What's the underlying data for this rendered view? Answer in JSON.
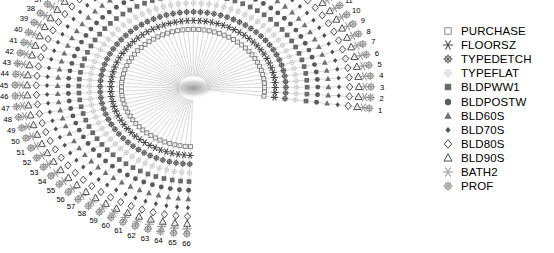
{
  "chart_data": {
    "type": "scatter",
    "title": "",
    "subtitle": "",
    "xlabel": "",
    "ylabel": "",
    "grid": false,
    "legend_position": "right",
    "n_spokes": 66,
    "spoke_labels": [
      "1",
      "2",
      "3",
      "4",
      "5",
      "6",
      "7",
      "8",
      "9",
      "10",
      "11",
      "12",
      "13",
      "14",
      "15",
      "16",
      "17",
      "18",
      "19",
      "20",
      "21",
      "22",
      "23",
      "24",
      "25",
      "26",
      "27",
      "28",
      "29",
      "30",
      "31",
      "32",
      "33",
      "34",
      "35",
      "36",
      "37",
      "38",
      "39",
      "40",
      "41",
      "42",
      "43",
      "44",
      "45",
      "46",
      "47",
      "48",
      "49",
      "50",
      "51",
      "52",
      "53",
      "54",
      "55",
      "56",
      "57",
      "58",
      "59",
      "60",
      "61",
      "62",
      "63",
      "64",
      "65",
      "66"
    ],
    "angle_start_deg": -8,
    "angle_end_deg": 268,
    "center": {
      "x": 193,
      "y": 88
    },
    "radius_inner": 26,
    "radius_outer": 178,
    "series": [
      {
        "name": "PURCHASE",
        "marker": "square-open",
        "color": "#7f7f7f",
        "ring": 1,
        "radius_frac": 0.3
      },
      {
        "name": "FLOORSZ",
        "marker": "asterisk",
        "color": "#4a4a4a",
        "ring": 2,
        "radius_frac": 0.37
      },
      {
        "name": "TYPEDETCH",
        "marker": "circle-plus",
        "color": "#555555",
        "ring": 3,
        "radius_frac": 0.44
      },
      {
        "name": "TYPEFLAT",
        "marker": "circle-faint",
        "color": "#cccccc",
        "ring": 4,
        "radius_frac": 0.51
      },
      {
        "name": "BLDPWW1",
        "marker": "square-filled",
        "color": "#6b6b6b",
        "ring": 5,
        "radius_frac": 0.58
      },
      {
        "name": "BLDPOSTW",
        "marker": "circle-filled",
        "color": "#5a5a5a",
        "ring": 6,
        "radius_frac": 0.65
      },
      {
        "name": "BLD60S",
        "marker": "triangle-filled",
        "color": "#707070",
        "ring": 7,
        "radius_frac": 0.72
      },
      {
        "name": "BLD70S",
        "marker": "diamond-small",
        "color": "#4f4f4f",
        "ring": 8,
        "radius_frac": 0.79
      },
      {
        "name": "BLD80S",
        "marker": "diamond-open",
        "color": "#3a3a3a",
        "ring": 9,
        "radius_frac": 0.86
      },
      {
        "name": "BLD90S",
        "marker": "triangle-open",
        "color": "#3a3a3a",
        "ring": 10,
        "radius_frac": 0.92
      },
      {
        "name": "BATH2",
        "marker": "asterisk",
        "color": "#9a9a9a",
        "ring": 11,
        "radius_frac": 0.96
      },
      {
        "name": "PROF",
        "marker": "circle-plus",
        "color": "#8a8a8a",
        "ring": 12,
        "radius_frac": 1.0
      }
    ]
  },
  "legend": {
    "items": [
      {
        "label": "PURCHASE",
        "marker": "square-open-icon",
        "color": "#7f7f7f"
      },
      {
        "label": "FLOORSZ",
        "marker": "asterisk-icon",
        "color": "#4a4a4a"
      },
      {
        "label": "TYPEDETCH",
        "marker": "circle-plus-icon",
        "color": "#555555"
      },
      {
        "label": "TYPEFLAT",
        "marker": "circle-faint-icon",
        "color": "#d0d0d0"
      },
      {
        "label": "BLDPWW1",
        "marker": "square-filled-icon",
        "color": "#6b6b6b"
      },
      {
        "label": "BLDPOSTW",
        "marker": "circle-filled-icon",
        "color": "#5a5a5a"
      },
      {
        "label": "BLD60S",
        "marker": "triangle-filled-icon",
        "color": "#707070"
      },
      {
        "label": "BLD70S",
        "marker": "diamond-small-icon",
        "color": "#4f4f4f"
      },
      {
        "label": "BLD80S",
        "marker": "diamond-open-icon",
        "color": "#3a3a3a"
      },
      {
        "label": "BLD90S",
        "marker": "triangle-open-icon",
        "color": "#3a3a3a"
      },
      {
        "label": "BATH2",
        "marker": "asterisk-icon",
        "color": "#9a9a9a"
      },
      {
        "label": "PROF",
        "marker": "circle-plus-icon",
        "color": "#8a8a8a"
      }
    ]
  },
  "colors": {
    "background": "#ffffff",
    "spoke_line": "#b8b8b8",
    "label_text": "#000000",
    "center_blob": "#9a9a9a"
  }
}
